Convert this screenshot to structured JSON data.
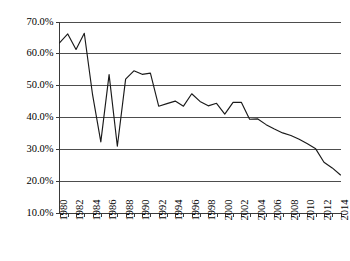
{
  "chart_data": {
    "type": "line",
    "title": "",
    "subtitle": "",
    "xlabel": "",
    "ylabel": "",
    "grid": true,
    "legend": false,
    "legend_position": "none",
    "xlim": [
      1980,
      2014
    ],
    "ylim": [
      0.1,
      0.7
    ],
    "y_tick_format": "percent-1dp",
    "y_ticks": [
      0.1,
      0.2,
      0.3,
      0.4,
      0.5,
      0.6,
      0.7
    ],
    "y_tick_labels": [
      "10.0%",
      "20.0%",
      "30.0%",
      "40.0%",
      "50.0%",
      "60.0%",
      "70.0%"
    ],
    "x_ticks": [
      1980,
      1982,
      1984,
      1986,
      1988,
      1990,
      1992,
      1994,
      1996,
      1998,
      2000,
      2002,
      2004,
      2006,
      2008,
      2010,
      2012,
      2014
    ],
    "x_tick_labels": [
      "1980",
      "1982",
      "1984",
      "1986",
      "1988",
      "1990",
      "1992",
      "1994",
      "1996",
      "1998",
      "2000",
      "2002",
      "2004",
      "2006",
      "2008",
      "2010",
      "2012",
      "2014"
    ],
    "x_minor_ticks_every": 1,
    "x": [
      1980,
      1981,
      1982,
      1983,
      1984,
      1985,
      1986,
      1987,
      1988,
      1989,
      1990,
      1991,
      1992,
      1993,
      1994,
      1995,
      1996,
      1997,
      1998,
      1999,
      2000,
      2001,
      2002,
      2003,
      2004,
      2005,
      2006,
      2007,
      2008,
      2009,
      2010,
      2011,
      2012,
      2013,
      2014
    ],
    "series": [
      {
        "name": "value",
        "color": "#1a1a1a",
        "values": [
          0.633,
          0.661,
          0.612,
          0.663,
          0.47,
          0.322,
          0.533,
          0.308,
          0.519,
          0.545,
          0.534,
          0.538,
          0.434,
          0.442,
          0.45,
          0.434,
          0.473,
          0.449,
          0.435,
          0.443,
          0.409,
          0.446,
          0.446,
          0.393,
          0.394,
          0.376,
          0.362,
          0.35,
          0.342,
          0.33,
          0.316,
          0.3,
          0.258,
          0.24,
          0.218
        ]
      }
    ]
  },
  "axes": {
    "y_axis_name": "percent-axis",
    "x_axis_name": "year-axis"
  }
}
